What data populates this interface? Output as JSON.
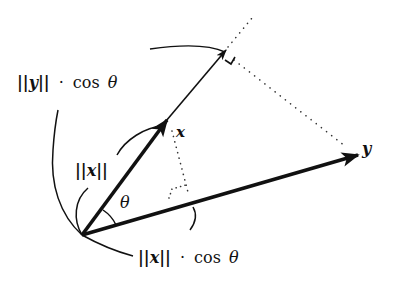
{
  "diagram": {
    "labels": {
      "x_vector": "x",
      "y_vector": "y",
      "theta": "θ",
      "norm_x": "||x||",
      "proj_x_on_y": {
        "norm": "||x||",
        "dot": "·",
        "cos": "cos",
        "theta": "θ"
      },
      "proj_y_on_x": {
        "norm": "||y||",
        "dot": "·",
        "cos": "cos",
        "theta": "θ"
      }
    },
    "vectors": [
      {
        "name": "x",
        "from": [
          82,
          235
        ],
        "to": [
          166,
          121
        ],
        "style": "bold-arrow"
      },
      {
        "name": "y",
        "from": [
          82,
          235
        ],
        "to": [
          357,
          155
        ],
        "style": "bold-arrow"
      },
      {
        "name": "projection-of-y-on-x",
        "from": [
          166,
          121
        ],
        "to": [
          226,
          50
        ],
        "style": "thin-arrow"
      }
    ],
    "colors": {
      "ink": "#111111",
      "background": "#ffffff"
    }
  }
}
